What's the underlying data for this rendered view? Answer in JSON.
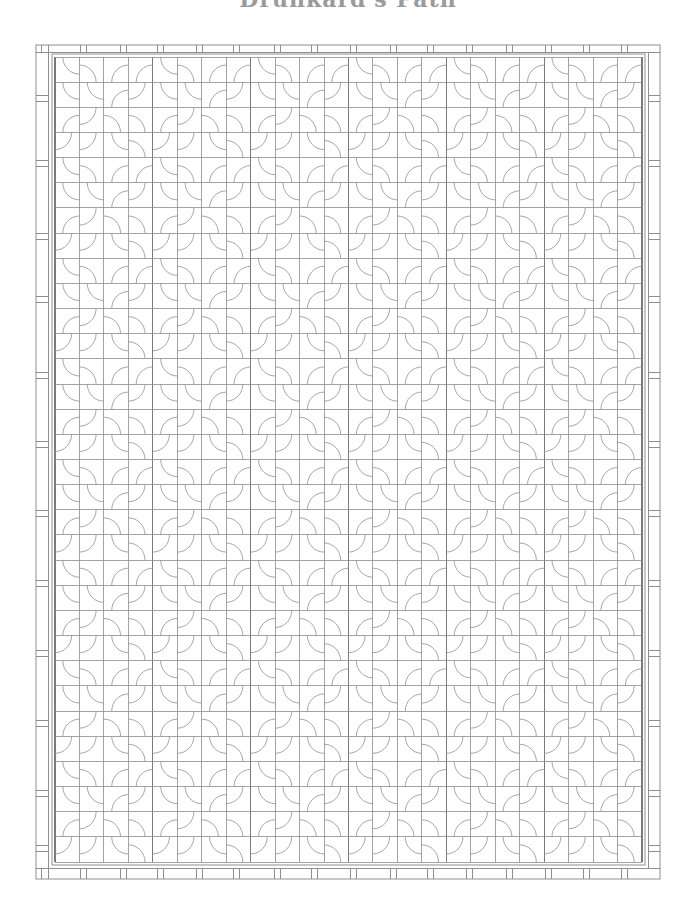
{
  "title": "Drunkard's Path",
  "colors": {
    "background": "#ffffff",
    "grid_line": "#8c8c8c",
    "block_line": "#7a7a7a",
    "arc_line": "#9b9b9b",
    "border_line": "#8f8f8f"
  },
  "quilt": {
    "outer_frame": {
      "x1": 36,
      "y1": 45,
      "x2": 660,
      "y2": 879
    },
    "inner_strip": {
      "left": 48,
      "top": 52,
      "right": 648,
      "bottom": 868
    },
    "grid": {
      "x0": 55,
      "y0": 57,
      "x1": 642,
      "y1": 862,
      "cols": 24,
      "rows": 32
    },
    "block_size_cells": 4,
    "arc_radius_fraction": 0.68,
    "block_pattern": [
      [
        "TR",
        "BL",
        "BR",
        "BR"
      ],
      [
        "TR",
        "TR",
        "BR",
        "TL"
      ],
      [
        "BR",
        "TL",
        "BL",
        "BL"
      ],
      [
        "TL",
        "TL",
        "TR",
        "BL"
      ]
    ],
    "border_keys": {
      "top": [
        41,
        48,
        80,
        86,
        120,
        126,
        157,
        163,
        196,
        202,
        233,
        239,
        274,
        280,
        311,
        317,
        350,
        356,
        390,
        396,
        427,
        433,
        466,
        472,
        506,
        512,
        545,
        551,
        583,
        589,
        621,
        627
      ],
      "bottom": [
        41,
        48,
        80,
        86,
        120,
        126,
        157,
        163,
        196,
        202,
        233,
        239,
        274,
        280,
        311,
        317,
        350,
        356,
        390,
        396,
        427,
        433,
        466,
        472,
        506,
        512,
        545,
        551,
        583,
        589,
        621,
        627
      ],
      "left": [
        95,
        101,
        160,
        166,
        233,
        239,
        296,
        302,
        372,
        378,
        441,
        447,
        510,
        516,
        580,
        586,
        650,
        656,
        720,
        726,
        790,
        796,
        845,
        851
      ],
      "right": [
        95,
        101,
        160,
        166,
        233,
        239,
        296,
        302,
        372,
        378,
        441,
        447,
        510,
        516,
        580,
        586,
        650,
        656,
        720,
        726,
        790,
        796,
        845,
        851
      ]
    }
  }
}
